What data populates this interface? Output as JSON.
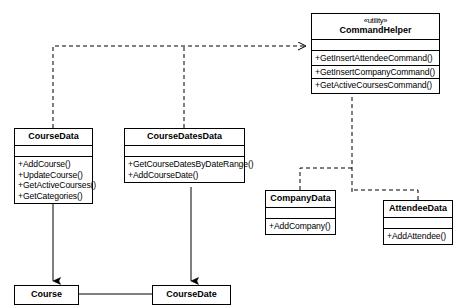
{
  "diagram": {
    "type": "uml-class-diagram",
    "background": "#ffffff",
    "line_color": "#000000"
  },
  "classes": {
    "command_helper": {
      "stereotype": "«utility»",
      "name": "CommandHelper",
      "attributes": [],
      "operations": [
        "+GetInsertAttendeeCommand()",
        "+GetInsertCompanyCommand()",
        "+GetActiveCoursesCommand()"
      ]
    },
    "course_data": {
      "name": "CourseData",
      "attributes": [],
      "operations": [
        "+AddCourse()",
        "+UpdateCourse()",
        "+GetActiveCourses()",
        "+GetCategories()"
      ]
    },
    "course_dates_data": {
      "name": "CourseDatesData",
      "attributes": [],
      "operations": [
        "+GetCourseDatesByDateRange()",
        "+AddCourseDate()"
      ]
    },
    "company_data": {
      "name": "CompanyData",
      "attributes": [],
      "operations": [
        "+AddCompany()"
      ]
    },
    "attendee_data": {
      "name": "AttendeeData",
      "attributes": [],
      "operations": [
        "+AddAttendee()"
      ]
    },
    "course": {
      "name": "Course"
    },
    "course_date": {
      "name": "CourseDate"
    }
  },
  "relationships": [
    {
      "from": "CourseData",
      "to": "CommandHelper",
      "style": "dashed",
      "arrow": "open"
    },
    {
      "from": "CourseDatesData",
      "to": "CommandHelper",
      "style": "dashed",
      "arrow": "open"
    },
    {
      "from": "CompanyData",
      "to": "CommandHelper",
      "style": "dashed",
      "arrow": "open"
    },
    {
      "from": "AttendeeData",
      "to": "CommandHelper",
      "style": "dashed",
      "arrow": "open"
    },
    {
      "from": "CourseData",
      "to": "Course",
      "style": "solid",
      "arrow": "filled"
    },
    {
      "from": "CourseDatesData",
      "to": "CourseDate",
      "style": "solid",
      "arrow": "filled"
    },
    {
      "from": "Course",
      "to": "CourseDate",
      "style": "solid",
      "arrow": "none"
    }
  ]
}
